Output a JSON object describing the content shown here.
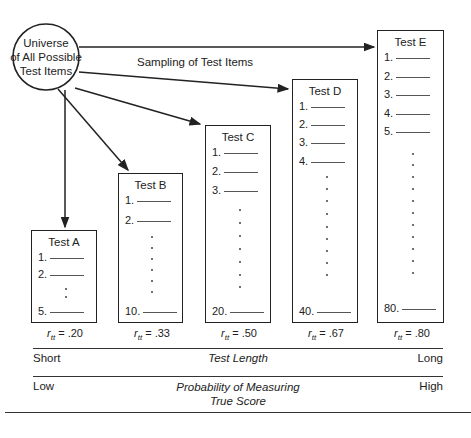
{
  "universe": {
    "line1": "Universe",
    "line2": "of All Possible",
    "line3": "Test Items"
  },
  "sampling_label": "Sampling of Test Items",
  "tests": [
    {
      "name": "Test A",
      "items": [
        "1.",
        "2.",
        "5."
      ],
      "rtt_value": ".20"
    },
    {
      "name": "Test B",
      "items": [
        "1.",
        "2.",
        "10."
      ],
      "rtt_value": ".33"
    },
    {
      "name": "Test C",
      "items": [
        "1.",
        "2.",
        "3.",
        "20."
      ],
      "rtt_value": ".50"
    },
    {
      "name": "Test D",
      "items": [
        "1.",
        "2.",
        "3.",
        "4.",
        "40."
      ],
      "rtt_value": ".67"
    },
    {
      "name": "Test E",
      "items": [
        "1.",
        "2.",
        "3.",
        "4.",
        "5.",
        "80."
      ],
      "rtt_value": ".80"
    }
  ],
  "rtt_prefix": "r",
  "rtt_sub": "tt",
  "rtt_eq": " = ",
  "axis1": {
    "left": "Short",
    "center": "Test Length",
    "right": "Long"
  },
  "axis2": {
    "left": "Low",
    "center_line1": "Probability of Measuring",
    "center_line2": "True Score",
    "right": "High"
  }
}
